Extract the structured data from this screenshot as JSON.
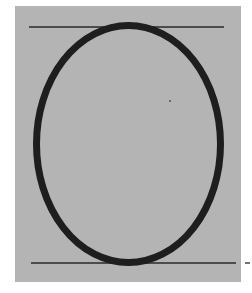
{
  "figure": {
    "colors": {
      "panel": "#b4b4b4",
      "stroke": "#1e1e1e",
      "guide": "#2a2a2a",
      "page": "#ffffff"
    },
    "glyph": "O"
  }
}
